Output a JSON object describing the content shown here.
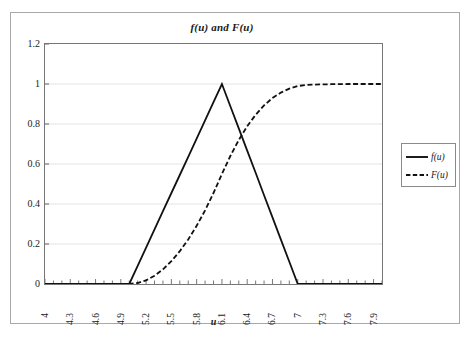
{
  "figure": {
    "title": "f(u) and F(u)",
    "background_color": "#ffffff",
    "frame_color": "#a8a8a8",
    "plot_border_color": "#777777",
    "gridline_color": "#e4e4e4",
    "series_color": "#111111"
  },
  "legend": {
    "position": "right",
    "entries": [
      {
        "label": "f(u)",
        "style": "solid",
        "icon": "solid-line-icon"
      },
      {
        "label": "F(u)",
        "style": "dashed",
        "icon": "dashed-line-icon"
      }
    ]
  },
  "chart_data": {
    "type": "line",
    "title": "f(u) and F(u)",
    "xlabel": "u",
    "ylabel": "",
    "xlim": [
      4,
      8
    ],
    "ylim": [
      0,
      1.2
    ],
    "grid": true,
    "legend_position": "right",
    "x_tick_labels": [
      "4",
      "4.3",
      "4.6",
      "4.9",
      "5.2",
      "5.5",
      "5.8",
      "6.1",
      "6.4",
      "6.7",
      "7",
      "7.3",
      "7.6",
      "7.9"
    ],
    "x_tick_values": [
      4,
      4.3,
      4.6,
      4.9,
      5.2,
      5.5,
      5.8,
      6.1,
      6.4,
      6.7,
      7,
      7.3,
      7.6,
      7.9
    ],
    "x_minor_tick_step": 0.1,
    "y_tick_labels": [
      "0",
      "0.2",
      "0.4",
      "0.6",
      "0.8",
      "1",
      "1.2"
    ],
    "y_tick_values": [
      0,
      0.2,
      0.4,
      0.6,
      0.8,
      1,
      1.2
    ],
    "x": [
      4.0,
      4.1,
      4.2,
      4.3,
      4.4,
      4.5,
      4.6,
      4.7,
      4.8,
      4.9,
      5.0,
      5.1,
      5.2,
      5.3,
      5.4,
      5.5,
      5.6,
      5.7,
      5.8,
      5.9,
      6.0,
      6.1,
      6.2,
      6.3,
      6.4,
      6.5,
      6.6,
      6.7,
      6.8,
      6.9,
      7.0,
      7.1,
      7.2,
      7.3,
      7.4,
      7.5,
      7.6,
      7.7,
      7.8,
      7.9,
      8.0
    ],
    "series": [
      {
        "name": "f(u)",
        "style": "solid",
        "values": [
          0,
          0,
          0,
          0,
          0,
          0,
          0,
          0,
          0,
          0,
          0,
          0.091,
          0.182,
          0.273,
          0.364,
          0.455,
          0.545,
          0.636,
          0.727,
          0.818,
          0.909,
          1.0,
          0.889,
          0.778,
          0.667,
          0.556,
          0.444,
          0.333,
          0.222,
          0.111,
          0,
          0,
          0,
          0,
          0,
          0,
          0,
          0,
          0,
          0,
          0
        ]
      },
      {
        "name": "F(u)",
        "style": "dashed",
        "values": [
          0,
          0,
          0,
          0,
          0,
          0,
          0,
          0,
          0,
          0,
          0,
          0.005,
          0.018,
          0.041,
          0.073,
          0.114,
          0.164,
          0.223,
          0.291,
          0.368,
          0.455,
          0.55,
          0.64,
          0.72,
          0.789,
          0.846,
          0.893,
          0.93,
          0.957,
          0.977,
          0.99,
          0.995,
          0.997,
          0.998,
          0.999,
          0.999,
          1.0,
          1.0,
          1.0,
          1.0,
          1.0
        ]
      }
    ]
  }
}
